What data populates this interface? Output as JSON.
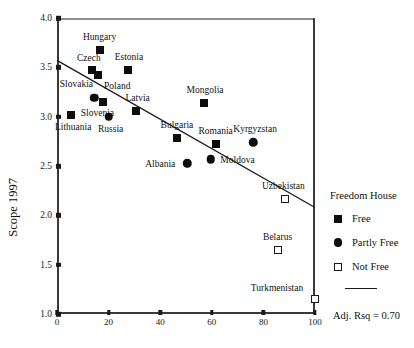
{
  "chart_data": {
    "type": "scatter",
    "title": "",
    "xlabel": "",
    "ylabel": "Scope 1997",
    "xlim": [
      0,
      100
    ],
    "ylim": [
      1.0,
      4.0
    ],
    "xticks": [
      0,
      20,
      40,
      60,
      80,
      100
    ],
    "xtick_labels": [
      "0",
      "20",
      "40",
      "60",
      "80",
      "100"
    ],
    "yticks": [
      1.0,
      1.5,
      2.0,
      2.5,
      3.0,
      3.5,
      4.0
    ],
    "ytick_labels": [
      "1.0",
      "1.5",
      "2.0",
      "2.5",
      "3.0",
      "3.5",
      "4.0"
    ],
    "grid": false,
    "legend_position": "right",
    "annotation": "Adj. Rsq = 0.70",
    "trendline": {
      "x0": 0,
      "y0": 3.57,
      "x1": 100,
      "y1": 2.08
    },
    "points": [
      {
        "label": "Hungary",
        "x": 16.5,
        "y": 3.68,
        "group": "Free",
        "label_dx": 0,
        "label_dy": -13
      },
      {
        "label": "Czech",
        "x": 13.5,
        "y": 3.47,
        "group": "Free",
        "label_dx": -3,
        "label_dy": -12
      },
      {
        "label": "Poland",
        "x": 16.0,
        "y": 3.42,
        "group": "Free",
        "label_dx": 19,
        "label_dy": 11
      },
      {
        "label": "Estonia",
        "x": 27.5,
        "y": 3.47,
        "group": "Free",
        "label_dx": 1,
        "label_dy": -13
      },
      {
        "label": "Slovakia",
        "x": 14.5,
        "y": 3.19,
        "group": "Partly Free",
        "label_dx": -18,
        "label_dy": -14
      },
      {
        "label": "Slovenia",
        "x": 18.0,
        "y": 3.15,
        "group": "Free",
        "label_dx": -6,
        "label_dy": 11
      },
      {
        "label": "Lithuania",
        "x": 5.5,
        "y": 3.02,
        "group": "Free",
        "label_dx": 2,
        "label_dy": 12
      },
      {
        "label": "Russia",
        "x": 20.0,
        "y": 3.0,
        "group": "Partly Free",
        "label_dx": 2,
        "label_dy": 12
      },
      {
        "label": "Latvia",
        "x": 30.5,
        "y": 3.06,
        "group": "Free",
        "label_dx": 2,
        "label_dy": -13
      },
      {
        "label": "Bulgaria",
        "x": 46.5,
        "y": 2.78,
        "group": "Free",
        "label_dx": 0,
        "label_dy": -13
      },
      {
        "label": "Mongolia",
        "x": 57.0,
        "y": 3.14,
        "group": "Free",
        "label_dx": 1,
        "label_dy": -13
      },
      {
        "label": "Romania",
        "x": 61.5,
        "y": 2.72,
        "group": "Free",
        "label_dx": 0,
        "label_dy": -13
      },
      {
        "label": "Moldova",
        "x": 59.5,
        "y": 2.57,
        "group": "Partly Free",
        "label_dx": 27,
        "label_dy": 1
      },
      {
        "label": "Kyrgyzstan",
        "x": 76.0,
        "y": 2.74,
        "group": "Partly Free",
        "label_dx": 2,
        "label_dy": -13
      },
      {
        "label": "Albania",
        "x": 50.5,
        "y": 2.53,
        "group": "Partly Free",
        "label_dx": -27,
        "label_dy": 1
      },
      {
        "label": "Uzbekistan",
        "x": 88.5,
        "y": 2.17,
        "group": "Not Free",
        "label_dx": -2,
        "label_dy": -13
      },
      {
        "label": "Belarus",
        "x": 85.5,
        "y": 1.65,
        "group": "Not Free",
        "label_dx": 0,
        "label_dy": -13
      },
      {
        "label": "Turkmenistan",
        "x": 100.0,
        "y": 1.15,
        "group": "Not Free",
        "label_dx": -38,
        "label_dy": -11
      }
    ]
  },
  "legend": {
    "title": "Freedom House",
    "items": [
      {
        "label": "Free",
        "marker": "filled-square"
      },
      {
        "label": "Partly Free",
        "marker": "filled-circle"
      },
      {
        "label": "Not Free",
        "marker": "open-square"
      }
    ]
  },
  "annotation": {
    "rsq": "Adj. Rsq = 0.70"
  }
}
